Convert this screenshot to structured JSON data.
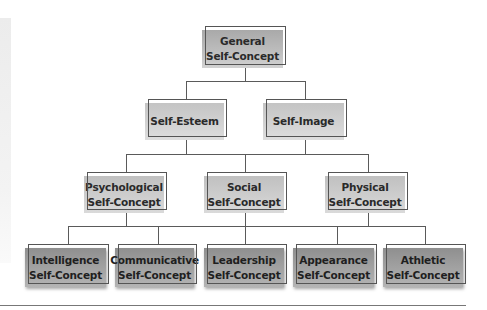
{
  "diagram": {
    "type": "hierarchy",
    "root": {
      "label_line1": "General",
      "label_line2": "Self-Concept"
    },
    "level2": [
      {
        "label": "Self-Esteem"
      },
      {
        "label": "Self-Image"
      }
    ],
    "level3": [
      {
        "label_line1": "Psychological",
        "label_line2": "Self-Concept"
      },
      {
        "label_line1": "Social",
        "label_line2": "Self-Concept"
      },
      {
        "label_line1": "Physical",
        "label_line2": "Self-Concept"
      }
    ],
    "level4": [
      {
        "label_line1": "Intelligence",
        "label_line2": "Self-Concept"
      },
      {
        "label_line1": "Communicative",
        "label_line2": "Self-Concept"
      },
      {
        "label_line1": "Leadership",
        "label_line2": "Self-Concept"
      },
      {
        "label_line1": "Appearance",
        "label_line2": "Self-Concept"
      },
      {
        "label_line1": "Athletic",
        "label_line2": "Self-Concept"
      }
    ],
    "colors": {
      "root_fill": "#b5b5b5",
      "mid_fill": "#d0d0d0",
      "leaf_fill": "#a0a0a0",
      "line": "#5a5a5a",
      "text": "#2a2a2a"
    }
  }
}
